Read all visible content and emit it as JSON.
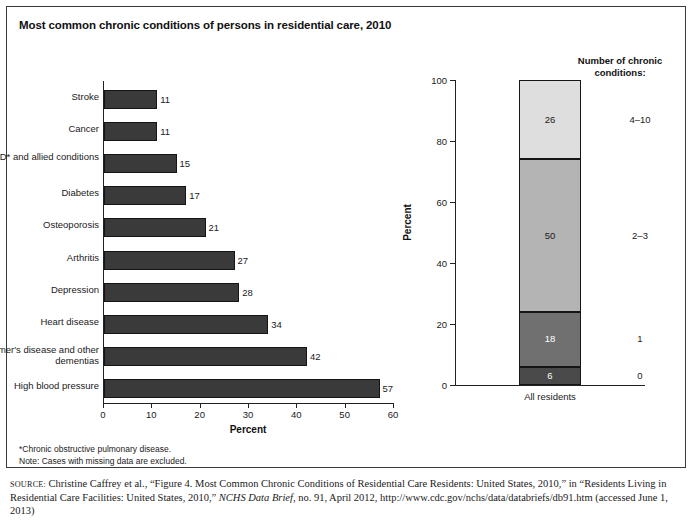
{
  "figure": {
    "title": "Most common chronic conditions of persons in residential care, 2010"
  },
  "footnotes": {
    "line1": "*Chronic obstructive pulmonary disease.",
    "line2": "Note: Cases with missing data are excluded."
  },
  "source": {
    "label": "source:",
    "text_a": " Christine Caffrey et al., “Figure 4. Most Common Chronic Conditions of Residential Care Residents: United States, 2010,” in “Residents Living in Residential Care Facilities: United States, 2010,” ",
    "italic": "NCHS Data Brief",
    "text_b": ", no. 91, April 2012, http://www.cdc.gov/nchs/data/databriefs/db91.htm (accessed June 1, 2013)"
  },
  "chart_data": [
    {
      "type": "bar",
      "orientation": "horizontal",
      "title": "Most common chronic conditions of persons in residential care, 2010",
      "xlabel": "Percent",
      "ylabel": "",
      "xlim": [
        0,
        60
      ],
      "xticks": [
        0,
        10,
        20,
        30,
        40,
        50,
        60
      ],
      "grid": false,
      "bar_color": "#3a3a3a",
      "categories": [
        "Stroke",
        "Cancer",
        "COPD* and allied conditions",
        "Diabetes",
        "Osteoporosis",
        "Arthritis",
        "Depression",
        "Heart disease",
        "Alzheimer's disease and other dementias",
        "High blood pressure"
      ],
      "values": [
        11,
        11,
        15,
        17,
        21,
        27,
        28,
        34,
        42,
        57
      ]
    },
    {
      "type": "bar",
      "orientation": "vertical",
      "stacked": true,
      "title": "",
      "legend_title": "Number of chronic conditions:",
      "legend_position": "right",
      "xlabel": "All residents",
      "ylabel": "Percent",
      "ylim": [
        0,
        100
      ],
      "yticks": [
        0,
        20,
        40,
        60,
        80,
        100
      ],
      "grid": false,
      "categories": [
        "All residents"
      ],
      "series": [
        {
          "name": "0",
          "values": [
            6
          ],
          "color": "#4a4a4a",
          "label_color": "#ffffff"
        },
        {
          "name": "1",
          "values": [
            18
          ],
          "color": "#707070",
          "label_color": "#ffffff"
        },
        {
          "name": "2–3",
          "values": [
            50
          ],
          "color": "#b4b4b4",
          "label_color": "#1a1a1a"
        },
        {
          "name": "4–10",
          "values": [
            26
          ],
          "color": "#dedede",
          "label_color": "#1a1a1a"
        }
      ]
    }
  ]
}
